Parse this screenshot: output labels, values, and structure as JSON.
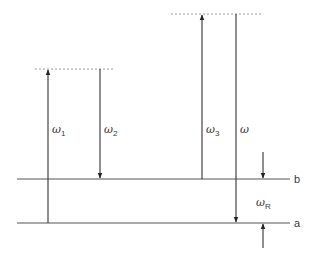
{
  "diagram": {
    "type": "energy-level-diagram",
    "levels": [
      {
        "id": "b",
        "label": "b",
        "y": 179
      },
      {
        "id": "a",
        "label": "a",
        "y": 223
      }
    ],
    "virtual_levels": [
      {
        "id": "v1",
        "y": 69,
        "x1": 35,
        "x2": 114
      },
      {
        "id": "v2",
        "y": 14,
        "x1": 171,
        "x2": 263
      }
    ],
    "transitions": [
      {
        "id": "omega1",
        "symbol": "ω",
        "subscript": "1",
        "direction": "up",
        "x": 48,
        "from": "a",
        "to": "v1"
      },
      {
        "id": "omega2",
        "symbol": "ω",
        "subscript": "2",
        "direction": "down",
        "x": 100,
        "from": "v1",
        "to": "b"
      },
      {
        "id": "omega3",
        "symbol": "ω",
        "subscript": "3",
        "direction": "up",
        "x": 202,
        "from": "b",
        "to": "v2"
      },
      {
        "id": "omega",
        "symbol": "ω",
        "subscript": "",
        "direction": "down",
        "x": 236,
        "from": "v2",
        "to": "a"
      }
    ],
    "resonance": {
      "symbol": "ω",
      "subscript": "R",
      "description": "spacing between levels a and b"
    }
  },
  "colors": {
    "line": "#3a3a3a",
    "dotted": "#9a9a9a"
  }
}
